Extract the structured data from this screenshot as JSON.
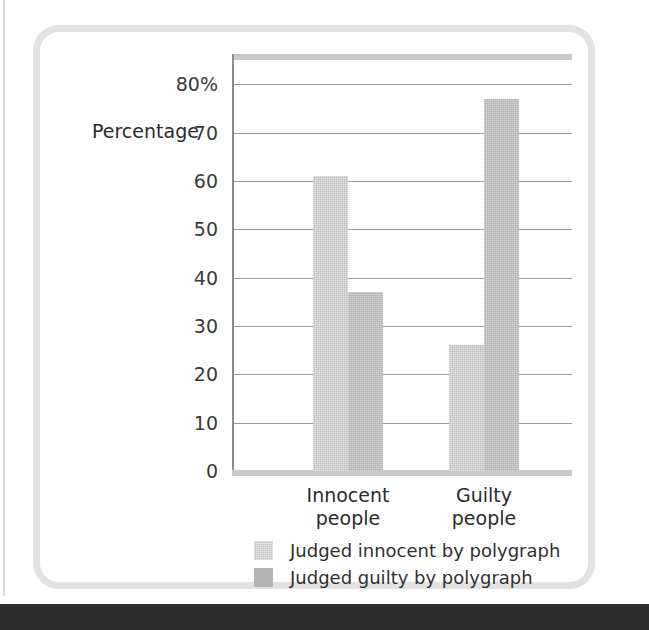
{
  "chart_data": {
    "type": "bar",
    "title": "",
    "xlabel": "",
    "ylabel": "Percentage",
    "ylim": [
      0,
      85
    ],
    "grid": true,
    "legend_position": "bottom",
    "categories": [
      "Innocent\npeople",
      "Guilty\npeople"
    ],
    "series": [
      {
        "name": "Judged innocent by polygraph",
        "values": [
          61,
          26
        ],
        "color": "#bdbdbd"
      },
      {
        "name": "Judged guilty by polygraph",
        "values": [
          37,
          77
        ],
        "color": "#b2b2b2"
      }
    ],
    "yticks": [
      {
        "value": 80,
        "label": "80%"
      },
      {
        "value": 70,
        "label": "70"
      },
      {
        "value": 60,
        "label": "60"
      },
      {
        "value": 50,
        "label": "50"
      },
      {
        "value": 40,
        "label": "40"
      },
      {
        "value": 30,
        "label": "30"
      },
      {
        "value": 20,
        "label": "20"
      },
      {
        "value": 10,
        "label": "10"
      },
      {
        "value": 0,
        "label": "0"
      }
    ]
  },
  "figure": {
    "axis_title": "Percentage",
    "categories": [
      {
        "line1": "Innocent",
        "line2": "people"
      },
      {
        "line1": "Guilty",
        "line2": "people"
      }
    ],
    "legend": [
      {
        "label": "Judged innocent by polygraph"
      },
      {
        "label": "Judged guilty by polygraph"
      }
    ]
  },
  "colors": {
    "frame": "#e2e2e2",
    "gridline": "#9a9a9a",
    "bar_light": "#bdbdbd",
    "bar_dark": "#b2b2b2",
    "text": "#2b2b2b",
    "page_band": "#2e2e2e"
  }
}
